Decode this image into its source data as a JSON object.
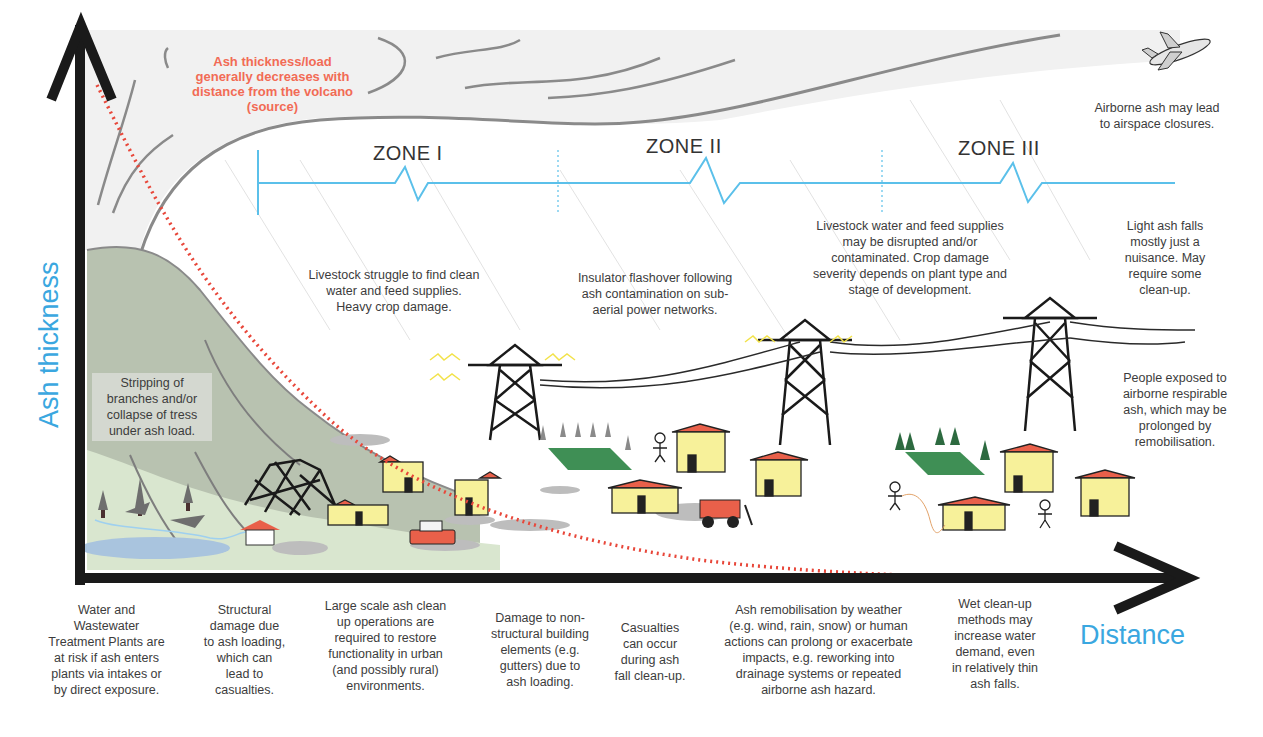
{
  "diagram": {
    "title_note": "Ash thickness/load\ngenerally decreases with\ndistance from the volcano\n(source)",
    "axes": {
      "y_label": "Ash thickness",
      "x_label": "Distance"
    },
    "zones": [
      {
        "label": "ZONE I"
      },
      {
        "label": "ZONE II"
      },
      {
        "label": "ZONE III"
      }
    ],
    "upper_notes": {
      "airspace": "Airborne ash may lead\nto airspace closures.",
      "zone1_livestock": "Livestock struggle to find clean\nwater and feed supplies.\nHeavy crop damage.",
      "insulator": "Insulator flashover following\nash contamination on sub-\naerial power networks.",
      "zone3_livestock": "Livestock water and feed supplies\nmay be disrupted and/or\ncontaminated.  Crop damage\nseverity depends on plant type and\nstage of development.",
      "light_ash": "Light ash falls\nmostly just a\nnuisance.  May\nrequire some\nclean-up.",
      "respirable": "People exposed to\nairborne respirable\nash, which may be\nprolonged by\nremobilisation.",
      "trees": "Stripping of\nbranches and/or\ncollapse of tress\nunder ash load."
    },
    "bottom_notes": [
      "Water and\nWastewater\nTreatment Plants are\nat risk if ash enters\nplants via intakes or\nby direct exposure.",
      "Structural\ndamage due\nto ash loading,\nwhich can\nlead to\ncasualties.",
      "Large scale ash clean\nup operations are\nrequired to restore\nfunctionality in urban\n(and possibly rural)\nenvironments.",
      "Damage to non-\nstructural building\nelements (e.g.\ngutters) due to\nash loading.",
      "Casualties\ncan occur\nduring ash\nfall clean-up.",
      "Ash remobilisation by weather\n(e.g. wind, rain, snow) or human\nactions can prolong or exacerbate\nimpacts, e.g. reworking into\ndrainage systems or repeated\nairborne ash hazard.",
      "Wet clean-up\nmethods may\nincrease water\ndemand, even\nin relatively thin\nash falls."
    ],
    "colors": {
      "axis": "#1a1a1a",
      "axis_label": "#3aa7e0",
      "zone_line": "#5bc0ea",
      "decay_curve": "#e8473a",
      "red_note": "#f26b55",
      "volcano": "#b9c2b0",
      "plume": "#f1f1f1",
      "house_wall": "#f7f19a",
      "house_roof": "#e9604a",
      "field": "#3f8f55"
    }
  }
}
